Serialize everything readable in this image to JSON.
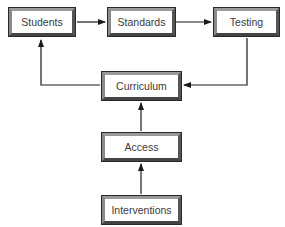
{
  "diagram": {
    "type": "flowchart",
    "nodes": [
      {
        "id": "students",
        "label": "Students"
      },
      {
        "id": "standards",
        "label": "Standards"
      },
      {
        "id": "testing",
        "label": "Testing"
      },
      {
        "id": "curriculum",
        "label": "Curriculum"
      },
      {
        "id": "access",
        "label": "Access"
      },
      {
        "id": "interventions",
        "label": "Interventions"
      }
    ],
    "edges": [
      {
        "from": "students",
        "to": "standards"
      },
      {
        "from": "standards",
        "to": "testing"
      },
      {
        "from": "testing",
        "to": "curriculum"
      },
      {
        "from": "curriculum",
        "to": "students"
      },
      {
        "from": "access",
        "to": "curriculum"
      },
      {
        "from": "interventions",
        "to": "access"
      }
    ],
    "colors": {
      "line": "#1a1a1a",
      "box_border": "#6e6e6e",
      "text": "#3a3a3a",
      "background": "#ffffff"
    }
  }
}
